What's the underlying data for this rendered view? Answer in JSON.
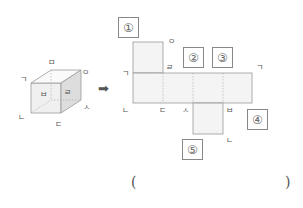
{
  "cube": {
    "labels": {
      "top_back": "ㅁ",
      "top_right": "ㅇ",
      "left": "ㄱ",
      "bottom_left": "ㄴ",
      "bottom": "ㄷ",
      "right": "ㅅ",
      "front_face": "ㅂ",
      "side_face": "ㄹ"
    }
  },
  "arrow": "➡",
  "net": {
    "labels": {
      "o": "ㅇ",
      "r": "ㄹ",
      "g_left": "ㄱ",
      "g_right": "ㄱ",
      "n_left": "ㄴ",
      "d": "ㄷ",
      "s": "ㅅ",
      "b": "ㅂ",
      "n_bottom": "ㄴ"
    },
    "boxes": [
      "①",
      "②",
      "③",
      "④",
      "⑤"
    ]
  },
  "answer": {
    "open": "(",
    "close": ")"
  }
}
